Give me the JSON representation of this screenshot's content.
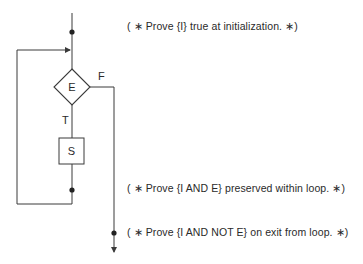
{
  "diagram": {
    "type": "flowchart",
    "nodes": {
      "decision": {
        "label": "E",
        "shape": "diamond"
      },
      "statement": {
        "label": "S",
        "shape": "rectangle"
      }
    },
    "branches": {
      "true_label": "T",
      "false_label": "F"
    },
    "annotations": [
      {
        "id": "init",
        "text": "( ∗ Prove {I} true at initialization.  ∗)"
      },
      {
        "id": "preserve",
        "text": "( ∗ Prove {I AND E} preserved within loop.  ∗)"
      },
      {
        "id": "exit",
        "text": "( ∗ Prove {I AND NOT E} on exit from loop.  ∗)"
      }
    ],
    "colors": {
      "stroke": "#3a3a3a",
      "text": "#2a2a2a",
      "background": "#ffffff"
    }
  }
}
